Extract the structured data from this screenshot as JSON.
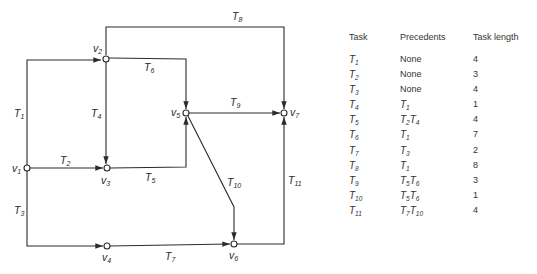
{
  "diagram": {
    "nodes": [
      {
        "id": "v1",
        "label": "v",
        "sub": "1"
      },
      {
        "id": "v2",
        "label": "v",
        "sub": "2"
      },
      {
        "id": "v3",
        "label": "v",
        "sub": "3"
      },
      {
        "id": "v4",
        "label": "v",
        "sub": "4"
      },
      {
        "id": "v5",
        "label": "v",
        "sub": "5"
      },
      {
        "id": "v6",
        "label": "v",
        "sub": "6"
      },
      {
        "id": "v7",
        "label": "v",
        "sub": "7"
      }
    ],
    "edges": [
      {
        "id": "T1",
        "label": "T",
        "sub": "1",
        "from": "v1",
        "to": "v2"
      },
      {
        "id": "T2",
        "label": "T",
        "sub": "2",
        "from": "v1",
        "to": "v3"
      },
      {
        "id": "T3",
        "label": "T",
        "sub": "3",
        "from": "v1",
        "to": "v4"
      },
      {
        "id": "T4",
        "label": "T",
        "sub": "4",
        "from": "v2",
        "to": "v3"
      },
      {
        "id": "T5",
        "label": "T",
        "sub": "5",
        "from": "v3",
        "to": "v5"
      },
      {
        "id": "T6",
        "label": "T",
        "sub": "6",
        "from": "v2",
        "to": "v5"
      },
      {
        "id": "T7",
        "label": "T",
        "sub": "7",
        "from": "v4",
        "to": "v6"
      },
      {
        "id": "T8",
        "label": "T",
        "sub": "8",
        "from": "v2",
        "to": "v7"
      },
      {
        "id": "T9",
        "label": "T",
        "sub": "9",
        "from": "v5",
        "to": "v7"
      },
      {
        "id": "T10",
        "label": "T",
        "sub": "10",
        "from": "v5",
        "to": "v6"
      },
      {
        "id": "T11",
        "label": "T",
        "sub": "11",
        "from": "v6",
        "to": "v7"
      }
    ]
  },
  "table": {
    "headers": [
      "Task",
      "Precedents",
      "Task length"
    ],
    "rows": [
      {
        "task": "T",
        "task_sub": "1",
        "prec": [
          {
            "t": "None",
            "s": ""
          }
        ],
        "length": "4"
      },
      {
        "task": "T",
        "task_sub": "2",
        "prec": [
          {
            "t": "None",
            "s": ""
          }
        ],
        "length": "3"
      },
      {
        "task": "T",
        "task_sub": "3",
        "prec": [
          {
            "t": "None",
            "s": ""
          }
        ],
        "length": "4"
      },
      {
        "task": "T",
        "task_sub": "4",
        "prec": [
          {
            "t": "T",
            "s": "1"
          }
        ],
        "length": "1"
      },
      {
        "task": "T",
        "task_sub": "5",
        "prec": [
          {
            "t": "T",
            "s": "2"
          },
          {
            "t": "T",
            "s": "4"
          }
        ],
        "length": "4"
      },
      {
        "task": "T",
        "task_sub": "6",
        "prec": [
          {
            "t": "T",
            "s": "1"
          }
        ],
        "length": "7"
      },
      {
        "task": "T",
        "task_sub": "7",
        "prec": [
          {
            "t": "T",
            "s": "3"
          }
        ],
        "length": "2"
      },
      {
        "task": "T",
        "task_sub": "8",
        "prec": [
          {
            "t": "T",
            "s": "1"
          }
        ],
        "length": "8"
      },
      {
        "task": "T",
        "task_sub": "9",
        "prec": [
          {
            "t": "T",
            "s": "5"
          },
          {
            "t": "T",
            "s": "6"
          }
        ],
        "length": "3"
      },
      {
        "task": "T",
        "task_sub": "10",
        "prec": [
          {
            "t": "T",
            "s": "5"
          },
          {
            "t": "T",
            "s": "6"
          }
        ],
        "length": "1"
      },
      {
        "task": "T",
        "task_sub": "11",
        "prec": [
          {
            "t": "T",
            "s": "7"
          },
          {
            "t": "T",
            "s": "10"
          }
        ],
        "length": "4"
      }
    ]
  }
}
